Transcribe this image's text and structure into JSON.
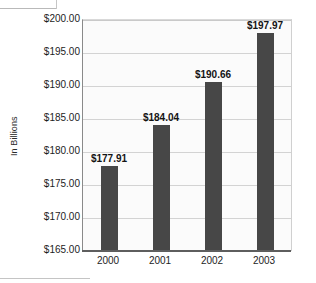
{
  "chart_data": {
    "type": "bar",
    "title": "",
    "subtitle": "",
    "xlabel": "",
    "ylabel": "In Billions",
    "categories": [
      "2000",
      "2001",
      "2002",
      "2003"
    ],
    "values": [
      177.91,
      184.04,
      190.66,
      197.97
    ],
    "data_labels": [
      "$177.91",
      "$184.04",
      "$190.66",
      "$197.97"
    ],
    "ylim": [
      165.0,
      200.0
    ],
    "ytick_values": [
      200.0,
      195.0,
      190.0,
      185.0,
      180.0,
      175.0,
      170.0,
      165.0
    ],
    "ytick_labels": [
      "$200.00",
      "$195.00",
      "$190.00",
      "$185.00",
      "$180.00",
      "$175.00",
      "$170.00",
      "$165.00"
    ],
    "grid": "horizontal",
    "legend": "none",
    "bar_color": "#474747",
    "plot_background": "#fbfbfb",
    "gridline_color": "#d3d3d3",
    "axis_color": "#5e5e5e"
  }
}
